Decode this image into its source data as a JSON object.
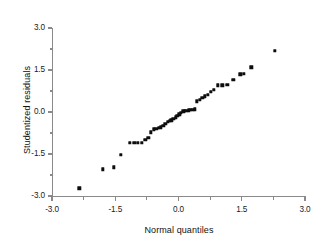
{
  "chart_data": {
    "type": "scatter",
    "title": "",
    "xlabel": "Normal quantiles",
    "ylabel": "Studentized residuals",
    "xlim": [
      -3.0,
      3.0
    ],
    "ylim": [
      -3.0,
      3.0
    ],
    "grid": false,
    "legend": null,
    "x_ticks": [
      "-3.0",
      "-1.5",
      "0.0",
      "1.5",
      "3.0"
    ],
    "x_tick_values": [
      -3.0,
      -1.5,
      0.0,
      1.5,
      3.0
    ],
    "y_ticks": [
      "3.0",
      "1.5",
      "0.0",
      "-1.5",
      "-3.0"
    ],
    "y_tick_values": [
      3.0,
      1.5,
      0.0,
      -1.5,
      -3.0
    ],
    "x_minor_tick_values": [
      -2.25,
      -0.75,
      0.75,
      2.25
    ],
    "y_minor_tick_values": [
      2.25,
      0.75,
      -0.75,
      -2.25
    ],
    "marker": "square",
    "marker_color": "#0d0d0d",
    "axis_color": "#8a8a8a",
    "points": [
      {
        "x": -2.35,
        "y": -2.72
      },
      {
        "x": -1.8,
        "y": -2.05
      },
      {
        "x": -1.54,
        "y": -1.97
      },
      {
        "x": -1.37,
        "y": -1.53
      },
      {
        "x": -1.16,
        "y": -1.1
      },
      {
        "x": -1.05,
        "y": -1.11
      },
      {
        "x": -0.96,
        "y": -1.11
      },
      {
        "x": -0.87,
        "y": -1.1
      },
      {
        "x": -0.79,
        "y": -1.0
      },
      {
        "x": -0.72,
        "y": -0.93
      },
      {
        "x": -0.65,
        "y": -0.72
      },
      {
        "x": -0.59,
        "y": -0.62
      },
      {
        "x": -0.53,
        "y": -0.59
      },
      {
        "x": -0.47,
        "y": -0.57
      },
      {
        "x": -0.42,
        "y": -0.55
      },
      {
        "x": -0.36,
        "y": -0.5
      },
      {
        "x": -0.31,
        "y": -0.43
      },
      {
        "x": -0.26,
        "y": -0.36
      },
      {
        "x": -0.21,
        "y": -0.31
      },
      {
        "x": -0.17,
        "y": -0.29
      },
      {
        "x": -0.12,
        "y": -0.25
      },
      {
        "x": -0.07,
        "y": -0.19
      },
      {
        "x": -0.03,
        "y": -0.14
      },
      {
        "x": 0.02,
        "y": -0.08
      },
      {
        "x": 0.06,
        "y": -0.02
      },
      {
        "x": 0.11,
        "y": 0.02
      },
      {
        "x": 0.15,
        "y": 0.04
      },
      {
        "x": 0.2,
        "y": 0.05
      },
      {
        "x": 0.24,
        "y": 0.06
      },
      {
        "x": 0.29,
        "y": 0.07
      },
      {
        "x": 0.34,
        "y": 0.08
      },
      {
        "x": 0.39,
        "y": 0.09
      },
      {
        "x": 0.44,
        "y": 0.38
      },
      {
        "x": 0.5,
        "y": 0.43
      },
      {
        "x": 0.56,
        "y": 0.5
      },
      {
        "x": 0.62,
        "y": 0.56
      },
      {
        "x": 0.69,
        "y": 0.62
      },
      {
        "x": 0.76,
        "y": 0.72
      },
      {
        "x": 0.84,
        "y": 0.8
      },
      {
        "x": 0.93,
        "y": 0.95
      },
      {
        "x": 1.04,
        "y": 0.96
      },
      {
        "x": 1.16,
        "y": 0.97
      },
      {
        "x": 1.3,
        "y": 1.14
      },
      {
        "x": 1.47,
        "y": 1.34
      },
      {
        "x": 1.55,
        "y": 1.36
      },
      {
        "x": 1.73,
        "y": 1.6
      },
      {
        "x": 2.28,
        "y": 2.18
      }
    ]
  }
}
